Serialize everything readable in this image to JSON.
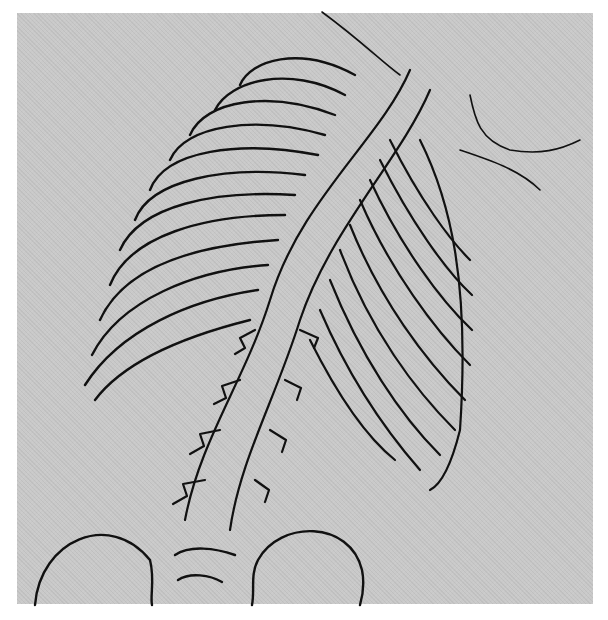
{
  "figure": {
    "background_color": "#c9c9c9",
    "line_color": "#111111",
    "page_color": "#ffffff"
  }
}
